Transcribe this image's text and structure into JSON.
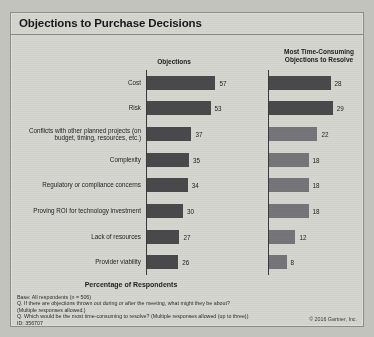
{
  "slide": {
    "title": "Objections to Purchase Decisions",
    "axis_title": "Percentage of Respondents",
    "copyright": "© 2016 Gartner, Inc.",
    "id_line": "ID: 356707"
  },
  "footnotes": [
    "Base: All respondents (n = 506)",
    "Q. If there are objections thrown out during or after the meeting, what might they be about?",
    "(Multiple responses allowed.)",
    "Q. Which would be the most time-consuming to resolve? (Multiple responses allowed (up to three))"
  ],
  "chart_data": [
    {
      "type": "bar",
      "title": "Objections",
      "xlabel": "Percentage of Respondents",
      "ylabel": "",
      "orientation": "horizontal",
      "xlim": [
        0,
        60
      ],
      "grid": false,
      "legend": "none",
      "bar_color": "#4a4a4c",
      "categories": [
        "Cost",
        "Risk",
        "Conflicts with other planned projects (on budget, timing, resources, etc.)",
        "Complexity",
        "Regulatory or compliance concerns",
        "Proving ROI for technology investment",
        "Lack of resources",
        "Provider viability"
      ],
      "values": [
        57,
        53,
        37,
        35,
        34,
        30,
        27,
        26
      ]
    },
    {
      "type": "bar",
      "title": "Most Time-Consuming Objections to Resolve",
      "xlabel": "Percentage of Respondents",
      "ylabel": "",
      "orientation": "horizontal",
      "xlim": [
        0,
        30
      ],
      "grid": false,
      "legend": "none",
      "bar_color": "#76767a",
      "categories": [
        "Cost",
        "Risk",
        "Conflicts with other planned projects (on budget, timing, resources, etc.)",
        "Complexity",
        "Regulatory or compliance concerns",
        "Proving ROI for technology investment",
        "Lack of resources",
        "Provider viability"
      ],
      "values": [
        28,
        29,
        22,
        18,
        18,
        18,
        12,
        8
      ]
    }
  ]
}
